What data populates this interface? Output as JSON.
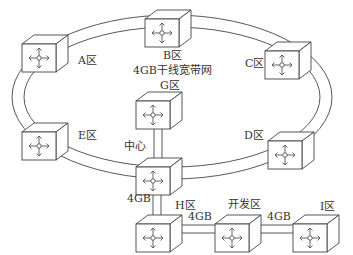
{
  "title": "4GB干线宽带网",
  "ring": {
    "label": "4GB干线宽带网",
    "stroke": "#333333"
  },
  "nodes": [
    {
      "id": "A",
      "label": "A区",
      "x": 22,
      "y": 35
    },
    {
      "id": "B",
      "label": "B区",
      "x": 145,
      "y": 10
    },
    {
      "id": "C",
      "label": "C区",
      "x": 265,
      "y": 42
    },
    {
      "id": "D",
      "label": "D区",
      "x": 268,
      "y": 132
    },
    {
      "id": "E",
      "label": "E区",
      "x": 22,
      "y": 123
    },
    {
      "id": "G",
      "label": "G区",
      "x": 136,
      "y": 92
    },
    {
      "id": "Center",
      "label": "中心",
      "x": 136,
      "y": 158
    },
    {
      "id": "H",
      "label": "H区",
      "x": 136,
      "y": 215
    },
    {
      "id": "Dev",
      "label": "开发区",
      "x": 215,
      "y": 215
    },
    {
      "id": "I",
      "label": "I区",
      "x": 293,
      "y": 215
    }
  ],
  "links": [
    {
      "from": "G",
      "to": "Center",
      "label": ""
    },
    {
      "from": "Center",
      "to": "H",
      "label": "4GB"
    },
    {
      "from": "H",
      "to": "Dev",
      "label": "4GB"
    },
    {
      "from": "Dev",
      "to": "I",
      "label": "4GB"
    }
  ],
  "labels": {
    "A": "A区",
    "B": "B区",
    "C": "C区",
    "D": "D区",
    "E": "E区",
    "G": "G区",
    "center": "中心",
    "H": "H区",
    "dev": "开发区",
    "I": "I区",
    "ring": "4GB干线宽带网",
    "link_center_h": "4GB",
    "link_h_dev": "4GB",
    "link_dev_i": "4GB"
  }
}
